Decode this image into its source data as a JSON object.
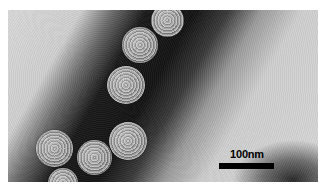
{
  "image": {
    "type": "transmission electron micrograph",
    "description": "Negatively stained icosahedral virus particles arranged along a dark stain band"
  },
  "scale_bar": {
    "label": "100nm",
    "color": "#000000"
  },
  "virions": [
    {
      "x": 151,
      "y": 10,
      "d": 33
    },
    {
      "x": 122,
      "y": 27,
      "d": 36
    },
    {
      "x": 107,
      "y": 66,
      "d": 38
    },
    {
      "x": 109,
      "y": 122,
      "d": 38
    },
    {
      "x": 36,
      "y": 130,
      "d": 37
    },
    {
      "x": 77,
      "y": 140,
      "d": 35
    },
    {
      "x": 48,
      "y": 168,
      "d": 30
    }
  ]
}
